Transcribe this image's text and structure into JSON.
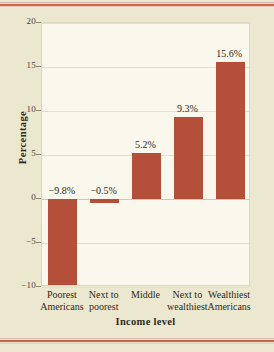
{
  "chart_data": {
    "type": "bar",
    "title": "",
    "subtitle": "",
    "xlabel": "Income level",
    "ylabel": "Percentage",
    "categories": [
      "Poorest Americans",
      "Next to poorest",
      "Middle",
      "Next to wealthiest",
      "Wealthiest Americans"
    ],
    "category_lines": [
      [
        "Poorest",
        "Americans"
      ],
      [
        "Next to",
        "poorest"
      ],
      [
        "Middle",
        ""
      ],
      [
        "Next to",
        "wealthiest"
      ],
      [
        "Wealthiest",
        "Americans"
      ]
    ],
    "values": [
      -9.8,
      -0.5,
      5.2,
      9.3,
      15.6
    ],
    "data_labels": [
      "−9.8%",
      "−0.5%",
      "5.2%",
      "9.3%",
      "15.6%"
    ],
    "ylim": [
      -10,
      20
    ],
    "yticks": [
      20,
      15,
      10,
      5,
      0,
      -5,
      -10
    ],
    "ytick_labels": [
      "20",
      "15",
      "10",
      "5",
      "0",
      "−5",
      "−10"
    ],
    "grid": true,
    "legend": false,
    "series": [
      {
        "name": "Percentage",
        "values": [
          -9.8,
          -0.5,
          5.2,
          9.3,
          15.6
        ]
      }
    ]
  },
  "colors": {
    "bar": "#b4503a",
    "page_background": "#ece7cf",
    "plot_background": "#faf7ec",
    "gridline": "#e6e0cb",
    "zero_line": "#cfc8b2",
    "text": "#2e2a22",
    "rule_accent": "#c96a4e"
  }
}
